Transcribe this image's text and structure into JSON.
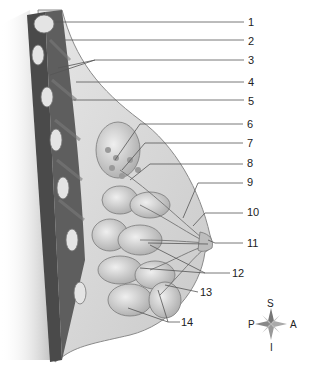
{
  "diagram": {
    "labels": [
      {
        "id": 1,
        "text": "1",
        "x": 248,
        "y": 17
      },
      {
        "id": 2,
        "text": "2",
        "x": 248,
        "y": 36
      },
      {
        "id": 3,
        "text": "3",
        "x": 248,
        "y": 55
      },
      {
        "id": 4,
        "text": "4",
        "x": 248,
        "y": 77
      },
      {
        "id": 5,
        "text": "5",
        "x": 248,
        "y": 96
      },
      {
        "id": 6,
        "text": "6",
        "x": 247,
        "y": 120
      },
      {
        "id": 7,
        "text": "7",
        "x": 247,
        "y": 139
      },
      {
        "id": 8,
        "text": "8",
        "x": 247,
        "y": 158
      },
      {
        "id": 9,
        "text": "9",
        "x": 247,
        "y": 177
      },
      {
        "id": 10,
        "text": "10",
        "x": 247,
        "y": 207
      },
      {
        "id": 11,
        "text": "11",
        "x": 247,
        "y": 238
      },
      {
        "id": 12,
        "text": "12",
        "x": 232,
        "y": 268
      },
      {
        "id": 13,
        "text": "13",
        "x": 200,
        "y": 287
      },
      {
        "id": 14,
        "text": "14",
        "x": 181,
        "y": 317
      }
    ],
    "compass": {
      "superior": "S",
      "inferior": "I",
      "posterior": "P",
      "anterior": "A"
    }
  }
}
